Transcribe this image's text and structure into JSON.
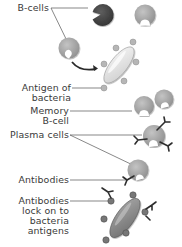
{
  "diagram": {
    "colors": {
      "b_cell_light": "#a8a8a8",
      "b_cell_dark": "#4a4a4a",
      "bacteria_body": "#e6e6e6",
      "antigen_knob": "#b4b4b4",
      "bacteria_locked": "#8c8c8c",
      "antibody": "#2e2e2e",
      "leader_line": "#555555",
      "label_text": "#3a3a3a"
    },
    "labels": [
      {
        "id": "b-cells",
        "lines": [
          "B-cells"
        ]
      },
      {
        "id": "antigen-of-bacteria",
        "lines": [
          "Antigen of",
          "bacteria"
        ]
      },
      {
        "id": "memory-b-cell",
        "lines": [
          "Memory",
          "B-cell"
        ]
      },
      {
        "id": "plasma-cells",
        "lines": [
          "Plasma cells"
        ]
      },
      {
        "id": "antibodies",
        "lines": [
          "Antibodies"
        ]
      },
      {
        "id": "antibodies-lock",
        "lines": [
          "Antibodies",
          "lock on to",
          "bacteria",
          "antigens"
        ]
      }
    ],
    "nodes": [
      {
        "id": "b-cell-dark",
        "type": "b-cell",
        "shade": "dark"
      },
      {
        "id": "b-cell-light-1",
        "type": "b-cell",
        "shade": "light"
      },
      {
        "id": "b-cell-activating",
        "type": "b-cell",
        "shade": "light"
      },
      {
        "id": "bacteria",
        "type": "bacteria",
        "antigens": 7
      },
      {
        "id": "memory-b-cell-1",
        "type": "b-cell",
        "shade": "light"
      },
      {
        "id": "memory-b-cell-2",
        "type": "b-cell",
        "shade": "light"
      },
      {
        "id": "plasma-cell",
        "type": "plasma-cell",
        "antibodies": 3
      },
      {
        "id": "plasma-cell-2",
        "type": "plasma-cell",
        "antibodies": 1
      },
      {
        "id": "bacteria-locked",
        "type": "bacteria",
        "antigens": 7,
        "antibodies_attached": 3
      }
    ],
    "edges": [
      {
        "from": "b-cell-activating",
        "to": "bacteria",
        "type": "arrow"
      }
    ]
  }
}
